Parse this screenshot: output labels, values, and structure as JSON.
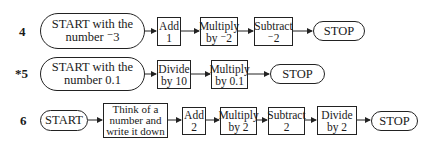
{
  "problems": [
    {
      "number": "4",
      "start": "START with the\nnumber ⁻3",
      "steps": [
        "Add\n1",
        "Multiply\nby ⁻2",
        "Subtract\n⁻2"
      ],
      "stop": "STOP"
    },
    {
      "number": "*5",
      "start": "START with the\nnumber 0.1",
      "steps": [
        "Divide\nby 10",
        "Multiply\nby 0.1"
      ],
      "stop": "STOP"
    },
    {
      "number": "6",
      "start": "START",
      "steps": [
        "Think of a\nnumber and\nwrite it down",
        "Add\n2",
        "Multiply\nby 2",
        "Subtract\n2",
        "Divide\nby 2"
      ],
      "stop": "STOP"
    }
  ]
}
